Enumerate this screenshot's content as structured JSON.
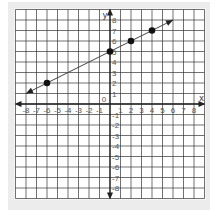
{
  "chart_data": {
    "type": "line",
    "title": "",
    "xlabel": "x",
    "ylabel": "y",
    "origin_label": "0",
    "xlim": [
      -9,
      9
    ],
    "ylim": [
      -9,
      9
    ],
    "grid": true,
    "x_tick_labels": [
      "-8",
      "-7",
      "-6",
      "-5",
      "-4",
      "-3",
      "-2",
      "-1",
      "1",
      "2",
      "3",
      "4",
      "5",
      "6",
      "7",
      "8"
    ],
    "y_tick_labels": [
      "8",
      "7",
      "6",
      "5",
      "4",
      "3",
      "2",
      "1",
      "-1",
      "-2",
      "-3",
      "-4",
      "-5",
      "-6",
      "-7",
      "-8"
    ],
    "line": {
      "equation": "y = 0.5x + 5",
      "slope": 0.5,
      "intercept": 5,
      "arrow_start": [
        -8,
        1
      ],
      "arrow_end": [
        6,
        8
      ]
    },
    "points": [
      {
        "x": -6,
        "y": 2
      },
      {
        "x": 0,
        "y": 5
      },
      {
        "x": 2,
        "y": 6
      },
      {
        "x": 4,
        "y": 7
      }
    ],
    "colors": {
      "grid": "#333333",
      "axis": "#222222",
      "line": "#444444",
      "point": "#111111",
      "background": "#ffffff",
      "frame": "#ececec"
    }
  }
}
